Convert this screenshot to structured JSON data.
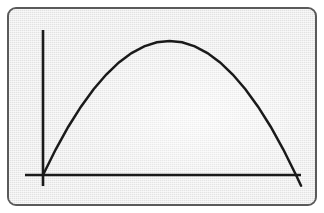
{
  "figure": {
    "title": "Parabolic arc with x and y axes",
    "frame": {
      "border_color": "#5a5a5a",
      "background_color": "#e9e9e9",
      "corner_radius": "9px"
    },
    "ink_color": "#1a1a1a",
    "page_background": "#ffffff"
  },
  "chart_data": {
    "type": "line",
    "title": "",
    "subtitle": "",
    "xlabel": "",
    "ylabel": "",
    "grid": false,
    "legend": null,
    "legend_position": "none",
    "tick_labels_x": [],
    "tick_labels_y": [],
    "axes": {
      "x_axis": {
        "label": "",
        "orientation": "horizontal",
        "pixel_y": 175,
        "pixel_x_start": 25,
        "pixel_x_end": 301
      },
      "y_axis": {
        "label": "",
        "orientation": "vertical",
        "pixel_x": 43,
        "pixel_y_top": 30,
        "pixel_y_bottom": 186
      },
      "origin": {
        "pixel_x": 43,
        "pixel_y": 175
      },
      "xlim": [
        0,
        1.02
      ],
      "ylim": [
        -0.08,
        1.07
      ]
    },
    "series": [
      {
        "name": "parabola",
        "description": "Downward opening parabola starting at the origin, peaking near the middle-left of the plot and descending through the x-axis at the right edge",
        "stroke_color": "#1a1a1a",
        "x": [
          0.0,
          0.05,
          0.1,
          0.15,
          0.2,
          0.25,
          0.3,
          0.35,
          0.4,
          0.45,
          0.5,
          0.55,
          0.6,
          0.65,
          0.7,
          0.75,
          0.8,
          0.85,
          0.9,
          0.95,
          1.0,
          1.02
        ],
        "y": [
          0.0,
          0.19,
          0.36,
          0.51,
          0.64,
          0.75,
          0.84,
          0.91,
          0.96,
          0.99,
          1.0,
          0.99,
          0.96,
          0.91,
          0.84,
          0.75,
          0.64,
          0.51,
          0.36,
          0.19,
          0.0,
          -0.08
        ],
        "peak": {
          "x": 0.5,
          "y": 1.0,
          "pixel_x": 170,
          "pixel_y": 41
        },
        "x_intercepts": [
          {
            "x": 0.0,
            "pixel_x": 43,
            "pixel_y": 175
          },
          {
            "x": 1.0,
            "pixel_x": 296,
            "pixel_y": 175
          }
        ],
        "endpoints": [
          {
            "pixel_x": 43,
            "pixel_y": 175
          },
          {
            "pixel_x": 302,
            "pixel_y": 187
          }
        ]
      }
    ]
  }
}
